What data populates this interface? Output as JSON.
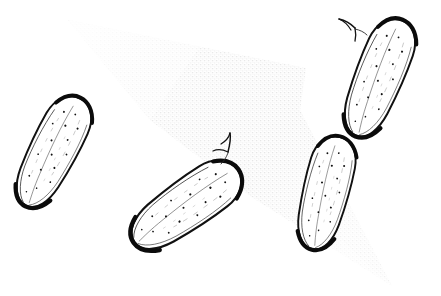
{
  "artwork": {
    "title": "Cucumbers",
    "subject": "cucumbers",
    "medium": "pen-and-ink line drawing",
    "style": "hand-drawn contour illustration with stippled shading",
    "background_color": "#ffffff",
    "ink_color": "#111111",
    "shadow_color": "#efefef",
    "canvas": {
      "width": 441,
      "height": 296
    }
  },
  "shadow": {
    "name": "cast-shadow-wedge",
    "description": "pale stippled triangular wedge of shading running from upper-left point toward lower-right",
    "fill": "#efefef",
    "apex": {
      "x": 68,
      "y": 20
    },
    "points": "68,20 306,68 300,110 392,286 250,196 150,120"
  },
  "objects": [
    {
      "id": "cucumber-left",
      "label": "cucumber-left",
      "position": {
        "x": 53,
        "y": 152
      },
      "length": 122,
      "width": 47,
      "rotation_deg": 27,
      "has_stem": false,
      "stem_label": "",
      "dot_count": 15,
      "outline_color": "#111111"
    },
    {
      "id": "cucumber-lower-center",
      "label": "cucumber-lower-center",
      "position": {
        "x": 186,
        "y": 206
      },
      "length": 128,
      "width": 50,
      "rotation_deg": 55,
      "has_stem": true,
      "stem_label": "stem-lower-center",
      "dot_count": 16,
      "outline_color": "#111111"
    },
    {
      "id": "cucumber-center-right",
      "label": "cucumber-center-right",
      "position": {
        "x": 326,
        "y": 193
      },
      "length": 117,
      "width": 46,
      "rotation_deg": 14,
      "has_stem": false,
      "stem_label": "",
      "dot_count": 16,
      "outline_color": "#111111"
    },
    {
      "id": "cucumber-upper-right",
      "label": "cucumber-upper-right",
      "position": {
        "x": 379,
        "y": 78
      },
      "length": 126,
      "width": 48,
      "rotation_deg": 22,
      "has_stem": true,
      "stem_label": "stem-upper-right",
      "dot_count": 17,
      "outline_color": "#111111"
    }
  ],
  "counts": {
    "cucumbers": 4,
    "stems": 2,
    "shadows": 1
  }
}
